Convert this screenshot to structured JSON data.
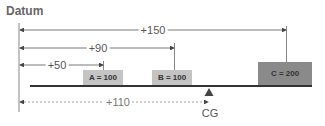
{
  "diagram": {
    "datum_label": "Datum",
    "dimensions": [
      {
        "label": "+150",
        "x_end": 286,
        "y": 30,
        "label_x": 153
      },
      {
        "label": "+90",
        "x_end": 174,
        "y": 48,
        "label_x": 98
      },
      {
        "label": "+50",
        "x_end": 103,
        "y": 65,
        "label_x": 57
      }
    ],
    "cg_dimension": {
      "label": "+110",
      "x_end": 208,
      "y": 102,
      "label_x": 118,
      "style": "dashed"
    },
    "weights": [
      {
        "label": "A = 100",
        "x": 83,
        "y": 70,
        "w": 40,
        "h": 15,
        "color": "#c4c4c4"
      },
      {
        "label": "B = 100",
        "x": 152,
        "y": 70,
        "w": 40,
        "h": 15,
        "color": "#c4c4c4"
      },
      {
        "label": "C = 200",
        "x": 258,
        "y": 62,
        "w": 54,
        "h": 23,
        "color": "#8a8a8a"
      }
    ],
    "cg_label": "CG",
    "colors": {
      "line": "#555555",
      "beam": "#333333",
      "light_box": "#c4c4c4",
      "dark_box": "#8a8a8a"
    }
  }
}
